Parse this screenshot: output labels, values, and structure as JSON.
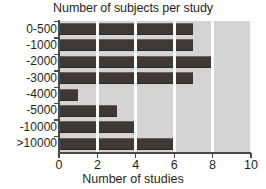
{
  "chart_data": {
    "type": "bar",
    "orientation": "horizontal",
    "title": "Number of subjects per study",
    "xlabel": "Number of studies",
    "ylabel": "",
    "categories": [
      "0-500",
      "-1000",
      "-2000",
      "-3000",
      "-4000",
      "-5000",
      "-10000",
      ">10000"
    ],
    "values": [
      7,
      7,
      8,
      7,
      1,
      3,
      4,
      6
    ],
    "xlim": [
      0,
      10
    ],
    "xticks": [
      0,
      2,
      4,
      6,
      8,
      10
    ],
    "xtick_labels": [
      "0",
      "2",
      "4",
      "6",
      "8",
      "10"
    ],
    "grid": "vertical-white",
    "legend": null,
    "colors": {
      "bar": "#3e3838",
      "plot_background": "#d4d4d4",
      "gridline": "#fbfbfb",
      "axis": "#4a4a4a",
      "text": "#1f1f1f",
      "figure_background": "#ffffff"
    }
  }
}
